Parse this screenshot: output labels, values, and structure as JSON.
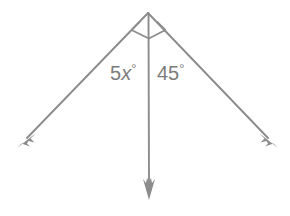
{
  "figure": {
    "line_color": "#8c8c8c",
    "label_color": "#7c7c7c",
    "background_color": "#ffffff",
    "vertex": {
      "x": 148,
      "y": 13
    },
    "rays": [
      {
        "name": "left-ray",
        "from": {
          "x": 148,
          "y": 13
        },
        "to": {
          "x": 18,
          "y": 147
        },
        "arrow": "down-left"
      },
      {
        "name": "vertical-ray",
        "from": {
          "x": 148,
          "y": 13
        },
        "to": {
          "x": 149,
          "y": 199
        },
        "arrow": "down"
      },
      {
        "name": "right-ray",
        "from": {
          "x": 148,
          "y": 13
        },
        "to": {
          "x": 277,
          "y": 147
        },
        "arrow": "down-right"
      }
    ],
    "angle_marks": [
      {
        "name": "left-angle-mark",
        "kind": "square-right-angle-mark"
      },
      {
        "name": "right-angle-mark",
        "kind": "square-right-angle-mark"
      }
    ],
    "labels": {
      "left_angle": {
        "coefficient": "5",
        "variable": "x",
        "degree_symbol": "°",
        "text": "5x°",
        "x": 110,
        "y": 80
      },
      "right_angle": {
        "value": "45",
        "degree_symbol": "°",
        "text": "45°",
        "x": 157,
        "y": 80
      }
    }
  }
}
